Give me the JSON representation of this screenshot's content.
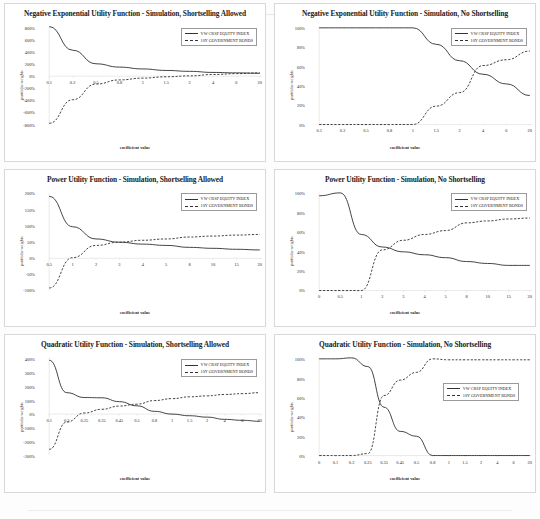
{
  "document": {
    "series_names": [
      "VW CRSP EQUITY INDEX",
      "10Y GOVERNMENT BONDS"
    ],
    "axis_x_title": "coefficient value",
    "axis_y_title": "portfolio weights"
  },
  "charts": [
    {
      "id": "neg-exp-shortselling-allowed",
      "title": "Negative Exponential Utility Function - Simulation, Shortselling Allowed",
      "legend_position": "top-right",
      "chart_data": {
        "type": "line",
        "title": "Negative Exponential Utility Function - Simulation, Shortselling Allowed",
        "xlabel": "coefficient value",
        "ylabel": "portfolio weights",
        "grid": false,
        "legend": "top-right",
        "categories": [
          "0.1",
          "0.2",
          "0.5",
          "0.8",
          "1",
          "1.5",
          "2",
          "4",
          "6",
          "20"
        ],
        "ylim": [
          -800,
          800
        ],
        "yticks": [
          "800%",
          "600%",
          "400%",
          "200%",
          "0%",
          "-200%",
          "-400%",
          "-600%",
          "-800%"
        ],
        "series": [
          {
            "name": "VW CRSP EQUITY INDEX",
            "style": "solid",
            "values": [
              820,
              430,
              205,
              150,
              120,
              95,
              80,
              62,
              55,
              48
            ]
          },
          {
            "name": "10Y GOVERNMENT BONDS",
            "style": "dashed",
            "values": [
              -780,
              -390,
              -130,
              -62,
              -32,
              -10,
              5,
              28,
              42,
              55
            ]
          }
        ]
      }
    },
    {
      "id": "neg-exp-no-shortselling",
      "title": "Negative Exponential Utility Function - Simulation, No Shortselling",
      "legend_position": "top-right",
      "chart_data": {
        "type": "line",
        "title": "Negative Exponential Utility Function - Simulation, No Shortselling",
        "xlabel": "coefficient value",
        "ylabel": "portfolio weights",
        "grid": false,
        "legend": "top-right",
        "categories": [
          "0.1",
          "0.2",
          "0.5",
          "0.8",
          "1",
          "1.5",
          "2",
          "4",
          "6",
          "20"
        ],
        "ylim": [
          0,
          100
        ],
        "yticks": [
          "100%",
          "80%",
          "60%",
          "40%",
          "20%",
          "0%"
        ],
        "series": [
          {
            "name": "VW CRSP EQUITY INDEX",
            "style": "solid",
            "values": [
              100,
              100,
              100,
              100,
              100,
              83,
              66,
              52,
              42,
              30
            ]
          },
          {
            "name": "10Y GOVERNMENT BONDS",
            "style": "dashed",
            "values": [
              0,
              0,
              0,
              0,
              0,
              19,
              33,
              61,
              67,
              76
            ]
          }
        ]
      }
    },
    {
      "id": "power-shortselling-allowed",
      "title": "Power Utility Function - Simulation, Shortselling Allowed",
      "legend_position": "top-right",
      "chart_data": {
        "type": "line",
        "title": "Power Utility Function - Simulation, Shortselling Allowed",
        "xlabel": "coefficient value",
        "ylabel": "portfolio weights",
        "grid": false,
        "legend": "top-right",
        "categories": [
          "0.5",
          "1",
          "2",
          "3",
          "4",
          "5",
          "8",
          "10",
          "15",
          "20"
        ],
        "ylim": [
          -100,
          200
        ],
        "yticks": [
          "200%",
          "150%",
          "100%",
          "50%",
          "0%",
          "-50%",
          "-100%"
        ],
        "series": [
          {
            "name": "VW CRSP EQUITY INDEX",
            "style": "solid",
            "values": [
              192,
              98,
              60,
              50,
              44,
              40,
              34,
              31,
              28,
              26
            ]
          },
          {
            "name": "10Y GOVERNMENT BONDS",
            "style": "dashed",
            "values": [
              -92,
              2,
              40,
              50,
              56,
              60,
              66,
              69,
              72,
              74
            ]
          }
        ]
      }
    },
    {
      "id": "power-no-shortselling",
      "title": "Power Utility Function - Simulation, No Shortselling",
      "legend_position": "top-right",
      "chart_data": {
        "type": "line",
        "title": "Power Utility Function - Simulation, No Shortselling",
        "xlabel": "coefficient value",
        "ylabel": "portfolio weights",
        "grid": false,
        "legend": "top-right",
        "categories": [
          "0",
          "0.5",
          "1",
          "2",
          "3",
          "4",
          "5",
          "8",
          "10",
          "15",
          "20"
        ],
        "ylim": [
          0,
          100
        ],
        "yticks": [
          "100%",
          "80%",
          "60%",
          "40%",
          "20%",
          "0%"
        ],
        "series": [
          {
            "name": "VW CRSP EQUITY INDEX",
            "style": "solid",
            "values": [
              98,
              101,
              58,
              45,
              40,
              37,
              34,
              30,
              28,
              26,
              26
            ]
          },
          {
            "name": "10Y GOVERNMENT BONDS",
            "style": "dashed",
            "values": [
              0,
              0,
              0,
              42,
              52,
              58,
              62,
              70,
              72,
              74,
              75
            ]
          }
        ]
      }
    },
    {
      "id": "quadratic-shortselling-allowed",
      "title": "Quadratic Utility Function - Simulation, Shortselling Allowed",
      "legend_position": "top-right",
      "chart_data": {
        "type": "line",
        "title": "Quadratic Utility Function - Simulation, Shortselling Allowed",
        "xlabel": "coefficient value",
        "ylabel": "portfolio weights",
        "grid": false,
        "legend": "top-right",
        "categories": [
          "0.1",
          "0.2",
          "0.25",
          "0.35",
          "0.45",
          "0.5",
          "0.8",
          "1",
          "1.5",
          "2",
          "4",
          "6",
          "20"
        ],
        "ylim": [
          -300,
          400
        ],
        "yticks": [
          "400%",
          "300%",
          "200%",
          "100%",
          "0%",
          "-100%",
          "-200%",
          "-300%"
        ],
        "series": [
          {
            "name": "VW CRSP EQUITY INDEX",
            "style": "solid",
            "values": [
              390,
              155,
              120,
              118,
              90,
              60,
              20,
              0,
              -12,
              -22,
              -38,
              -45,
              -52
            ]
          },
          {
            "name": "10Y GOVERNMENT BONDS",
            "style": "dashed",
            "values": [
              -255,
              -58,
              8,
              35,
              58,
              72,
              98,
              112,
              125,
              132,
              142,
              148,
              155
            ]
          }
        ]
      }
    },
    {
      "id": "quadratic-no-shortselling",
      "title": "Quadratic Utility Function - Simulation, No Shortselling",
      "legend_position": "right",
      "chart_data": {
        "type": "line",
        "title": "Quadratic Utility Function - Simulation, No Shortselling",
        "xlabel": "coefficient value",
        "ylabel": "portfolio weights",
        "grid": false,
        "legend": "right",
        "categories": [
          "0",
          "0.1",
          "0.2",
          "0.25",
          "0.35",
          "0.45",
          "0.5",
          "0.8",
          "1",
          "1.5",
          "2",
          "4",
          "6",
          "20"
        ],
        "ylim": [
          0,
          100
        ],
        "yticks": [
          "100%",
          "80%",
          "60%",
          "40%",
          "20%",
          "0%"
        ],
        "series": [
          {
            "name": "VW CRSP EQUITY INDEX",
            "style": "solid",
            "values": [
              100,
              100,
              101,
              92,
              50,
              25,
              20,
              0,
              0,
              0,
              0,
              0,
              0,
              0
            ]
          },
          {
            "name": "10Y GOVERNMENT BONDS",
            "style": "dashed",
            "values": [
              0,
              0,
              0,
              2,
              62,
              78,
              86,
              100,
              99,
              99,
              99,
              99,
              99,
              99
            ]
          }
        ]
      }
    }
  ]
}
